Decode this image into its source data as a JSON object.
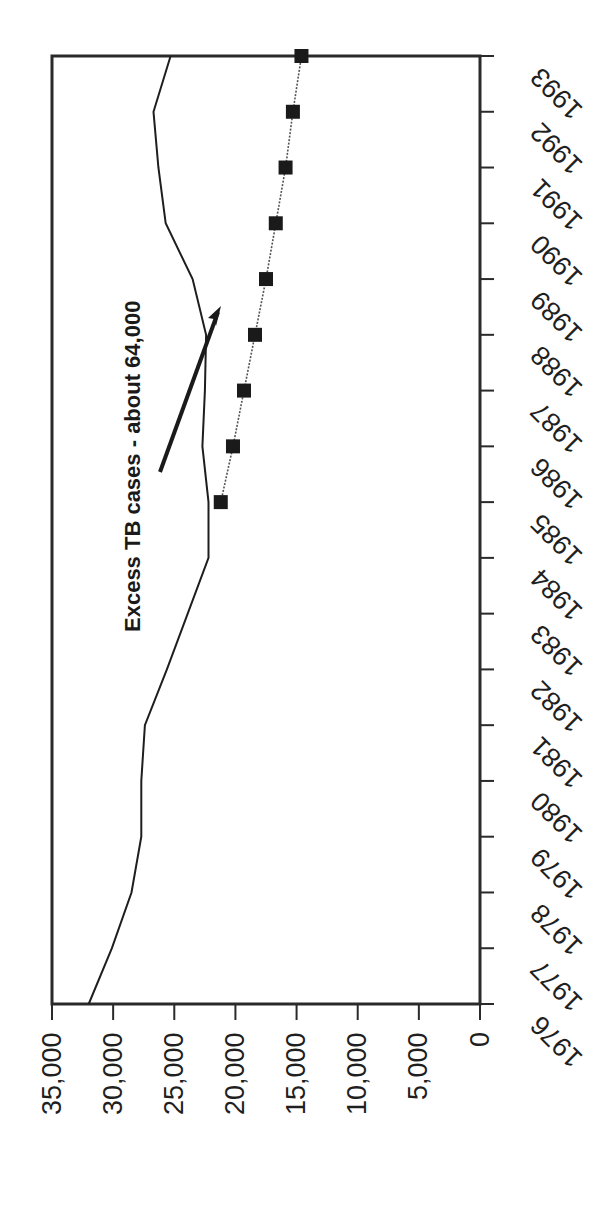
{
  "chart_data": {
    "type": "line",
    "title": "",
    "orientation": "rotated 90° clockwise (years run top-to-bottom on right edge, values along bottom from 35,000 at left to 0 at right)",
    "xlabel": "",
    "ylabel": "",
    "ylim": [
      0,
      35000
    ],
    "grid": false,
    "legend": null,
    "x": [
      1976,
      1977,
      1978,
      1979,
      1980,
      1981,
      1982,
      1983,
      1984,
      1985,
      1986,
      1987,
      1988,
      1989,
      1990,
      1991,
      1992,
      1993
    ],
    "x_tick_labels": [
      "1976",
      "1977",
      "1978",
      "1979",
      "1980",
      "1981",
      "1982",
      "1983",
      "1984",
      "1985",
      "1986",
      "1987",
      "1988",
      "1989",
      "1990",
      "1991",
      "1992",
      "1993"
    ],
    "y_tick_labels": [
      "35,000",
      "30,000",
      "25,000",
      "20,000",
      "15,000",
      "10,000",
      "5,000",
      "0"
    ],
    "y_ticks": [
      35000,
      30000,
      25000,
      20000,
      15000,
      10000,
      5000,
      0
    ],
    "series": [
      {
        "name": "Reported TB cases",
        "style": "solid line",
        "x": [
          1976,
          1977,
          1978,
          1979,
          1980,
          1981,
          1982,
          1983,
          1984,
          1985,
          1986,
          1987,
          1988,
          1989,
          1990,
          1991,
          1992,
          1993
        ],
        "values": [
          32000,
          30100,
          28500,
          27700,
          27700,
          27400,
          25600,
          23900,
          22200,
          22200,
          22700,
          22500,
          22400,
          23500,
          25700,
          26300,
          26700,
          25300
        ]
      },
      {
        "name": "Expected TB cases (projected trend)",
        "style": "dotted line with square markers",
        "x": [
          1985,
          1986,
          1987,
          1988,
          1989,
          1990,
          1991,
          1992,
          1993
        ],
        "values": [
          21200,
          20200,
          19300,
          18400,
          17500,
          16700,
          15900,
          15300,
          14600
        ]
      }
    ],
    "annotations": [
      {
        "text": "Excess TB cases - about 64,000",
        "arrow": true,
        "arrow_points_to": "gap between reported and expected lines around 1988-1989"
      }
    ]
  },
  "labels": {
    "annotation": "Excess TB cases - about 64,000"
  }
}
